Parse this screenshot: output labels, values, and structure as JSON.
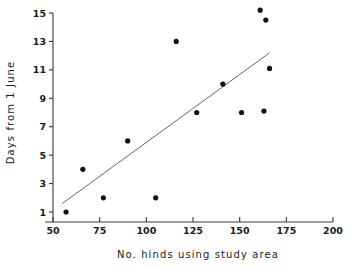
{
  "chart_data": {
    "type": "scatter",
    "title": "",
    "xlabel": "No. hinds using study area",
    "ylabel": "Days from 1 June",
    "xlim": [
      50,
      200
    ],
    "ylim": [
      1,
      15
    ],
    "grid": false,
    "legend": "none",
    "xticks": [
      50,
      75,
      100,
      125,
      150,
      175,
      200
    ],
    "xtick_labels": [
      "50",
      "75",
      "100",
      "125",
      "150",
      "175",
      "200"
    ],
    "yticks": [
      1,
      3,
      5,
      7,
      9,
      11,
      13,
      15
    ],
    "ytick_labels": [
      "1",
      "3",
      "5",
      "7",
      "9",
      "11",
      "13",
      "15"
    ],
    "points": [
      {
        "x": 57,
        "y": 1.0
      },
      {
        "x": 66,
        "y": 4.0
      },
      {
        "x": 77,
        "y": 2.0
      },
      {
        "x": 90,
        "y": 6.0
      },
      {
        "x": 105,
        "y": 2.0
      },
      {
        "x": 116,
        "y": 13.0
      },
      {
        "x": 127,
        "y": 8.0
      },
      {
        "x": 141,
        "y": 10.0
      },
      {
        "x": 151,
        "y": 8.0
      },
      {
        "x": 161,
        "y": 15.2
      },
      {
        "x": 163,
        "y": 8.1
      },
      {
        "x": 164,
        "y": 14.5
      },
      {
        "x": 166,
        "y": 11.1
      }
    ],
    "fit_line": {
      "x0": 55,
      "y0": 1.6,
      "x1": 166,
      "y1": 12.2
    },
    "marker_radius_px": 2.6,
    "colors": {
      "marker": "#111111",
      "line": "#555555",
      "axis": "#3a3a3a",
      "text": "#1a1a1a",
      "background": "#ffffff"
    }
  }
}
